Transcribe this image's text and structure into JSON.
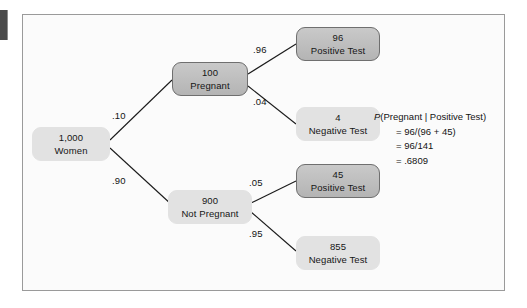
{
  "figure": {
    "type": "probability-tree-diagram",
    "nodes": {
      "root": {
        "count": "1,000",
        "label": "Women",
        "style": "light"
      },
      "pregnant": {
        "count": "100",
        "label": "Pregnant",
        "style": "dark"
      },
      "not_pregnant": {
        "count": "900",
        "label": "Not Pregnant",
        "style": "light"
      },
      "preg_pos": {
        "count": "96",
        "label": "Positive Test",
        "style": "dark"
      },
      "preg_neg": {
        "count": "4",
        "label": "Negative Test",
        "style": "light"
      },
      "notpreg_pos": {
        "count": "45",
        "label": "Positive Test",
        "style": "dark"
      },
      "notpreg_neg": {
        "count": "855",
        "label": "Negative Test",
        "style": "light"
      }
    },
    "branch_labels": {
      "root_to_pregnant": ".10",
      "root_to_not_pregnant": ".90",
      "pregnant_to_positive": ".96",
      "pregnant_to_negative": ".04",
      "not_pregnant_to_positive": ".05",
      "not_pregnant_to_negative": ".95"
    },
    "formula": {
      "line1_italic": "P",
      "line1_rest": "(Pregnant  |  Positive Test)",
      "line2": "= 96/(96 + 45)",
      "line3": "= 96/141",
      "line4": "= .6809"
    },
    "colors": {
      "dark_node_fill": "#bdbdbd",
      "dark_node_border": "#6f6f6f",
      "light_node_fill": "#e2e2e2",
      "frame_border": "#9a9a9a",
      "edge_line": "#1b1b1b",
      "text": "#161616",
      "page_background": "#fbfbfb"
    }
  }
}
